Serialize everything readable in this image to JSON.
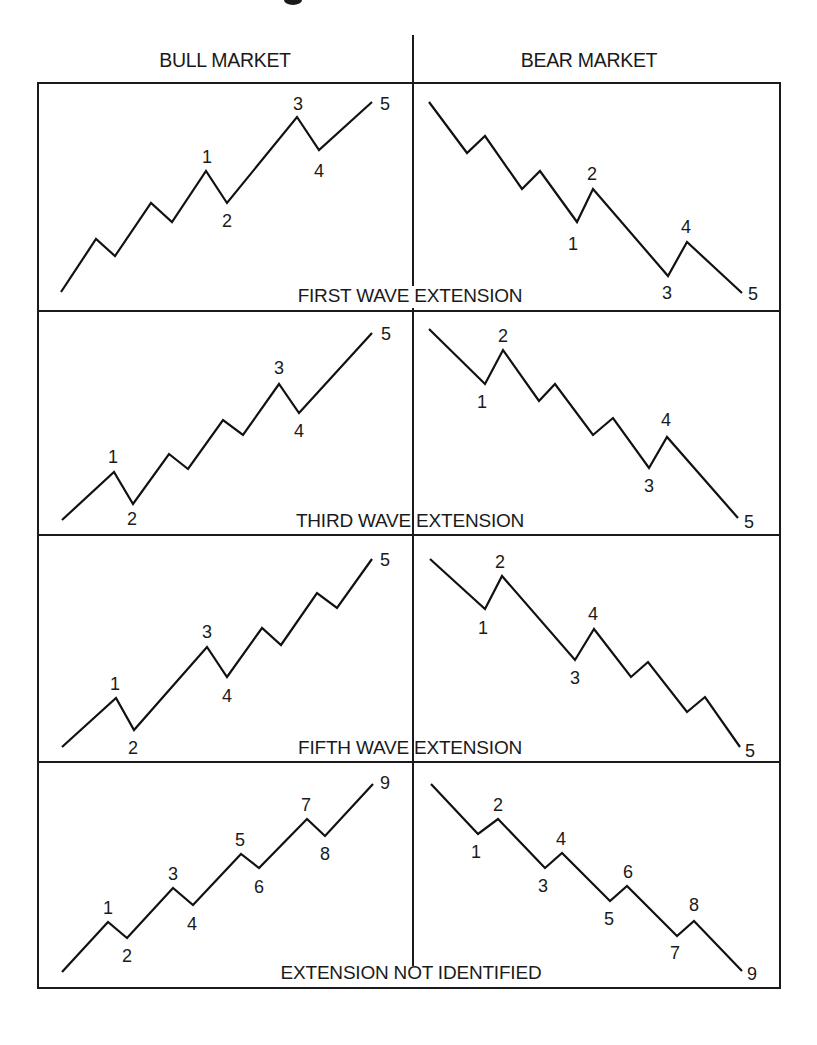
{
  "colors": {
    "ink": "#1a1a1a",
    "background": "#ffffff"
  },
  "header": {
    "left_label": "BULL MARKET",
    "right_label": "BEAR MARKET"
  },
  "layout": {
    "frame": {
      "x": 38,
      "y": 83,
      "w": 742,
      "h": 905
    },
    "center_x": 413,
    "center_top": 35,
    "dividers_y": [
      311,
      535,
      762
    ]
  },
  "panels": [
    {
      "caption": "FIRST WAVE EXTENSION",
      "caption_x": 410,
      "caption_y": 302,
      "caption_gap": [
        286,
        308
      ],
      "bull": {
        "points": [
          [
            61,
            292
          ],
          [
            96,
            239
          ],
          [
            115,
            256
          ],
          [
            151,
            203
          ],
          [
            172,
            222
          ],
          [
            206,
            171
          ],
          [
            227,
            203
          ],
          [
            297,
            117
          ],
          [
            319,
            150
          ],
          [
            372,
            102
          ]
        ],
        "labels": [
          {
            "text": "1",
            "x": 207,
            "y": 163
          },
          {
            "text": "2",
            "x": 227,
            "y": 227
          },
          {
            "text": "3",
            "x": 298,
            "y": 110
          },
          {
            "text": "4",
            "x": 319,
            "y": 177
          },
          {
            "text": "5",
            "x": 385,
            "y": 110
          }
        ]
      },
      "bear": {
        "points": [
          [
            429,
            102
          ],
          [
            467,
            153
          ],
          [
            485,
            136
          ],
          [
            522,
            189
          ],
          [
            540,
            171
          ],
          [
            577,
            222
          ],
          [
            593,
            189
          ],
          [
            668,
            276
          ],
          [
            687,
            242
          ],
          [
            742,
            293
          ]
        ],
        "labels": [
          {
            "text": "1",
            "x": 573,
            "y": 250
          },
          {
            "text": "2",
            "x": 592,
            "y": 180
          },
          {
            "text": "3",
            "x": 667,
            "y": 299
          },
          {
            "text": "4",
            "x": 686,
            "y": 233
          },
          {
            "text": "5",
            "x": 753,
            "y": 300
          }
        ]
      }
    },
    {
      "caption": "THIRD WAVE EXTENSION",
      "caption_x": 410,
      "caption_y": 527,
      "caption_gap": null,
      "bull": {
        "points": [
          [
            62,
            520
          ],
          [
            114,
            472
          ],
          [
            133,
            504
          ],
          [
            169,
            454
          ],
          [
            188,
            469
          ],
          [
            223,
            420
          ],
          [
            243,
            435
          ],
          [
            279,
            384
          ],
          [
            299,
            413
          ],
          [
            372,
            333
          ]
        ],
        "labels": [
          {
            "text": "1",
            "x": 113,
            "y": 463
          },
          {
            "text": "2",
            "x": 132,
            "y": 525
          },
          {
            "text": "3",
            "x": 279,
            "y": 374
          },
          {
            "text": "4",
            "x": 299,
            "y": 437
          },
          {
            "text": "5",
            "x": 386,
            "y": 340
          }
        ]
      },
      "bear": {
        "points": [
          [
            429,
            329
          ],
          [
            485,
            384
          ],
          [
            503,
            350
          ],
          [
            539,
            401
          ],
          [
            555,
            384
          ],
          [
            593,
            435
          ],
          [
            613,
            418
          ],
          [
            649,
            468
          ],
          [
            667,
            437
          ],
          [
            738,
            518
          ]
        ],
        "labels": [
          {
            "text": "1",
            "x": 482,
            "y": 408
          },
          {
            "text": "2",
            "x": 503,
            "y": 342
          },
          {
            "text": "3",
            "x": 649,
            "y": 492
          },
          {
            "text": "4",
            "x": 666,
            "y": 426
          },
          {
            "text": "5",
            "x": 749,
            "y": 528
          }
        ]
      }
    },
    {
      "caption": "FIFTH WAVE EXTENSION",
      "caption_x": 410,
      "caption_y": 754,
      "caption_gap": null,
      "bull": {
        "points": [
          [
            62,
            747
          ],
          [
            116,
            698
          ],
          [
            134,
            730
          ],
          [
            207,
            647
          ],
          [
            227,
            677
          ],
          [
            262,
            628
          ],
          [
            281,
            645
          ],
          [
            317,
            593
          ],
          [
            337,
            608
          ],
          [
            372,
            559
          ]
        ],
        "labels": [
          {
            "text": "1",
            "x": 115,
            "y": 690
          },
          {
            "text": "2",
            "x": 133,
            "y": 754
          },
          {
            "text": "3",
            "x": 207,
            "y": 638
          },
          {
            "text": "4",
            "x": 227,
            "y": 702
          },
          {
            "text": "5",
            "x": 385,
            "y": 566
          }
        ]
      },
      "bear": {
        "points": [
          [
            430,
            559
          ],
          [
            485,
            609
          ],
          [
            502,
            576
          ],
          [
            575,
            660
          ],
          [
            594,
            629
          ],
          [
            631,
            677
          ],
          [
            648,
            662
          ],
          [
            687,
            712
          ],
          [
            705,
            697
          ],
          [
            740,
            747
          ]
        ],
        "labels": [
          {
            "text": "1",
            "x": 483,
            "y": 634
          },
          {
            "text": "2",
            "x": 500,
            "y": 568
          },
          {
            "text": "3",
            "x": 575,
            "y": 684
          },
          {
            "text": "4",
            "x": 593,
            "y": 620
          },
          {
            "text": "5",
            "x": 750,
            "y": 757
          }
        ]
      }
    },
    {
      "caption": "EXTENSION NOT IDENTIFIED",
      "caption_x": 411,
      "caption_y": 979,
      "caption_gap": null,
      "bull": {
        "points": [
          [
            62,
            972
          ],
          [
            108,
            922
          ],
          [
            127,
            938
          ],
          [
            173,
            888
          ],
          [
            193,
            905
          ],
          [
            241,
            854
          ],
          [
            259,
            868
          ],
          [
            307,
            819
          ],
          [
            325,
            836
          ],
          [
            373,
            784
          ]
        ],
        "labels": [
          {
            "text": "1",
            "x": 108,
            "y": 914
          },
          {
            "text": "2",
            "x": 127,
            "y": 962
          },
          {
            "text": "3",
            "x": 173,
            "y": 880
          },
          {
            "text": "4",
            "x": 192,
            "y": 930
          },
          {
            "text": "5",
            "x": 240,
            "y": 846
          },
          {
            "text": "6",
            "x": 259,
            "y": 893
          },
          {
            "text": "7",
            "x": 306,
            "y": 811
          },
          {
            "text": "8",
            "x": 325,
            "y": 860
          },
          {
            "text": "9",
            "x": 385,
            "y": 789
          }
        ]
      },
      "bear": {
        "points": [
          [
            431,
            784
          ],
          [
            478,
            834
          ],
          [
            498,
            819
          ],
          [
            545,
            868
          ],
          [
            562,
            853
          ],
          [
            610,
            901
          ],
          [
            627,
            886
          ],
          [
            677,
            936
          ],
          [
            694,
            921
          ],
          [
            742,
            971
          ]
        ],
        "labels": [
          {
            "text": "1",
            "x": 476,
            "y": 858
          },
          {
            "text": "2",
            "x": 498,
            "y": 811
          },
          {
            "text": "3",
            "x": 543,
            "y": 892
          },
          {
            "text": "4",
            "x": 561,
            "y": 845
          },
          {
            "text": "5",
            "x": 609,
            "y": 925
          },
          {
            "text": "6",
            "x": 628,
            "y": 878
          },
          {
            "text": "7",
            "x": 675,
            "y": 959
          },
          {
            "text": "8",
            "x": 694,
            "y": 911
          },
          {
            "text": "9",
            "x": 752,
            "y": 980
          }
        ]
      }
    }
  ]
}
